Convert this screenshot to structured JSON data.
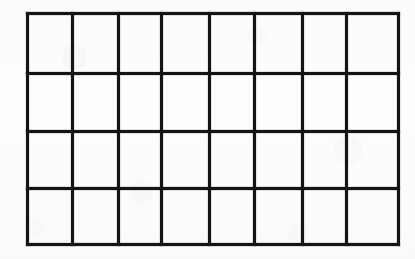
{
  "document": {
    "kind": "scanned-grid-table",
    "appearance": "photocopied hand-drawn empty grid on white paper",
    "canvas": {
      "width": 415,
      "height": 259
    },
    "background_color": "#fdfdfc",
    "line_color": "#141414",
    "line_thickness_px": 3
  },
  "grid": {
    "columns": 8,
    "rows": 4,
    "total_cells": 32,
    "bounds": {
      "left": 26,
      "top": 12,
      "right": 397,
      "bottom": 243
    },
    "column_edges_x": [
      26,
      71,
      117,
      160,
      208,
      253,
      301,
      345,
      397
    ],
    "row_edges_y": [
      12,
      72,
      130,
      187,
      243
    ],
    "column_widths": [
      45,
      46,
      43,
      48,
      45,
      48,
      44,
      52
    ],
    "row_heights": [
      60,
      58,
      57,
      56
    ],
    "vertical_line_count": 9,
    "horizontal_line_count": 5
  },
  "cells": {
    "content": "",
    "all_empty": true,
    "rows": [
      [
        "",
        "",
        "",
        "",
        "",
        "",
        "",
        ""
      ],
      [
        "",
        "",
        "",
        "",
        "",
        "",
        "",
        ""
      ],
      [
        "",
        "",
        "",
        "",
        "",
        "",
        "",
        ""
      ],
      [
        "",
        "",
        "",
        "",
        "",
        "",
        "",
        ""
      ]
    ]
  }
}
